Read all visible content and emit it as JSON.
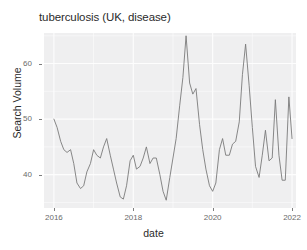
{
  "chart_data": {
    "type": "line",
    "title": "tuberculosis (UK, disease)",
    "xlabel": "date",
    "ylabel": "Search Volume",
    "xlim": [
      2015.75,
      2022.1
    ],
    "ylim": [
      34.0,
      65.5
    ],
    "xticks": [
      2016,
      2018,
      2020,
      2022
    ],
    "xtick_labels": [
      "2016",
      "2018",
      "2020",
      "2022"
    ],
    "yticks": [
      40,
      50,
      60
    ],
    "ytick_labels": [
      "40",
      "50",
      "60"
    ],
    "grid": true,
    "legend": "none",
    "series_name": "Search Volume",
    "line_color": "#7a7a7a",
    "panel_color": "#efeff0",
    "gridline_color": "#fdfdfd",
    "x": [
      2016.0,
      2016.08,
      2016.17,
      2016.25,
      2016.33,
      2016.42,
      2016.5,
      2016.58,
      2016.67,
      2016.75,
      2016.83,
      2016.92,
      2017.0,
      2017.08,
      2017.17,
      2017.25,
      2017.33,
      2017.42,
      2017.5,
      2017.58,
      2017.67,
      2017.75,
      2017.83,
      2017.92,
      2018.0,
      2018.08,
      2018.17,
      2018.25,
      2018.33,
      2018.42,
      2018.5,
      2018.58,
      2018.67,
      2018.75,
      2018.83,
      2018.92,
      2019.0,
      2019.08,
      2019.17,
      2019.25,
      2019.33,
      2019.42,
      2019.5,
      2019.58,
      2019.67,
      2019.75,
      2019.83,
      2019.92,
      2020.0,
      2020.08,
      2020.17,
      2020.25,
      2020.33,
      2020.42,
      2020.5,
      2020.58,
      2020.67,
      2020.75,
      2020.83,
      2020.92,
      2021.0,
      2021.08,
      2021.17,
      2021.25,
      2021.33,
      2021.42,
      2021.5,
      2021.58,
      2021.67,
      2021.75,
      2021.83
    ],
    "values": [
      50.0,
      48.5,
      46.0,
      44.5,
      44.0,
      44.5,
      42.0,
      38.5,
      37.5,
      38.0,
      40.5,
      42.0,
      44.5,
      43.5,
      43.0,
      45.0,
      46.5,
      43.5,
      41.0,
      38.5,
      36.0,
      35.6,
      38.0,
      42.5,
      43.5,
      41.0,
      41.5,
      43.0,
      45.0,
      42.0,
      43.0,
      43.0,
      40.0,
      37.0,
      35.4,
      39.5,
      43.0,
      46.5,
      52.5,
      57.5,
      65.0,
      56.5,
      54.5,
      55.5,
      49.0,
      44.5,
      41.0,
      38.0,
      37.0,
      38.5,
      44.5,
      46.5,
      43.5,
      43.5,
      45.5,
      46.0,
      49.5,
      58.0,
      63.5,
      56.0,
      48.5,
      41.5,
      39.5,
      43.5,
      48.0,
      42.5,
      43.0,
      53.5,
      43.5,
      39.0,
      39.0
    ],
    "tail_x": [
      2021.83,
      2021.92,
      2022.0
    ],
    "tail_values": [
      39.0,
      54.0,
      46.5
    ],
    "n_points": 74,
    "peak_value": 65.0,
    "peak_x": 2019.33,
    "min_value": 35.4,
    "min_x": 2018.83
  }
}
